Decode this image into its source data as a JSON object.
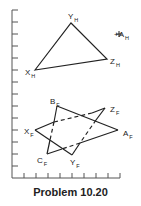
{
  "caption": "Problem 10.20",
  "colors": {
    "line": "#222222",
    "axis": "#555555",
    "background": "#ffffff"
  },
  "axes": {
    "vertical": {
      "x": 12,
      "y_top": 10,
      "y_bottom": 178,
      "tick_spacing": 12,
      "tick_length": 6
    },
    "horizontal": {
      "y": 178,
      "x_left": 12,
      "x_right": 120,
      "tick_spacing": 12,
      "tick_length": 5
    }
  },
  "top_view": {
    "triangle": {
      "X_H": [
        35,
        70
      ],
      "Y_H": [
        71,
        23
      ],
      "Z_H": [
        107,
        59
      ]
    },
    "point_A_H": [
      119,
      34
    ],
    "labels": [
      {
        "main": "Y",
        "sub": "H",
        "x": 68,
        "y": 19
      },
      {
        "main": "X",
        "sub": "H",
        "x": 25,
        "y": 75
      },
      {
        "main": "Z",
        "sub": "H",
        "x": 110,
        "y": 64
      },
      {
        "main": "+A",
        "sub": "H",
        "x": 114,
        "y": 37
      }
    ]
  },
  "front_view": {
    "triangle_XYZ": {
      "X_F": [
        35,
        130
      ],
      "Y_F": [
        72,
        155
      ],
      "Z_F": [
        105,
        108
      ]
    },
    "triangle_ABC": {
      "A_F": [
        118,
        130
      ],
      "B_F": [
        57,
        106
      ],
      "C_F": [
        47,
        154
      ]
    },
    "labels": [
      {
        "main": "B",
        "sub": "F",
        "x": 50,
        "y": 104
      },
      {
        "main": "Z",
        "sub": "F",
        "x": 110,
        "y": 112
      },
      {
        "main": "X",
        "sub": "F",
        "x": 24,
        "y": 134
      },
      {
        "main": "A",
        "sub": "F",
        "x": 123,
        "y": 136
      },
      {
        "main": "C",
        "sub": "F",
        "x": 37,
        "y": 163
      },
      {
        "main": "Y",
        "sub": "F",
        "x": 70,
        "y": 165
      }
    ]
  }
}
